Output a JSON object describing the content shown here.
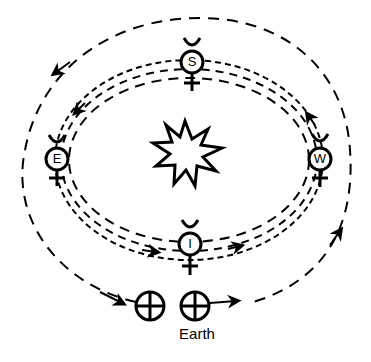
{
  "diagram": {
    "type": "orbital-diagram",
    "center_symbol": "sun-star",
    "mercury_positions": [
      {
        "id": "superior",
        "letter": "S",
        "x": 192,
        "y": 62
      },
      {
        "id": "eastern",
        "letter": "E",
        "x": 57,
        "y": 159
      },
      {
        "id": "western",
        "letter": "W",
        "x": 320,
        "y": 159
      },
      {
        "id": "inferior",
        "letter": "I",
        "x": 190,
        "y": 244
      }
    ],
    "earth": {
      "label": "Earth",
      "symbol": "earth-cross-circle",
      "positions": 2
    },
    "orbits": {
      "outer": "earth-orbit-dashed",
      "inner_count": 3,
      "direction": "counterclockwise"
    },
    "colors": {
      "stroke": "#000000",
      "background": "#ffffff"
    }
  }
}
